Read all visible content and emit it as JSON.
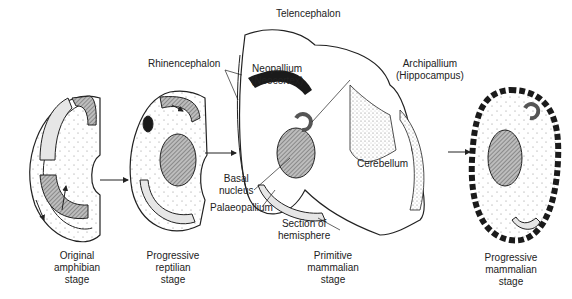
{
  "labels": {
    "telencephalon": "Telencephalon",
    "rhinencephalon": "Rhinencephalon",
    "neopallium": [
      "Neopallium",
      "(Neocortex)"
    ],
    "archipallium": [
      "Archipallium",
      "(Hippocampus)"
    ],
    "cerebellum": "Cerebellum",
    "basal_nucleus": [
      "Basal",
      "nucleus"
    ],
    "palaeopallium": "Palaeopallium",
    "section": [
      "Section of",
      "hemisphere"
    ]
  },
  "stages": [
    {
      "lines": [
        "Original",
        "amphibian",
        "stage"
      ]
    },
    {
      "lines": [
        "Progressive",
        "reptilian",
        "stage"
      ]
    },
    {
      "lines": [
        "Primitive",
        "mammalian",
        "stage"
      ]
    },
    {
      "lines": [
        "Progressive",
        "mammalian",
        "stage"
      ]
    }
  ],
  "colors": {
    "line": "#222222",
    "hatch": "#8a8a8a",
    "light_fill": "#e6e6e6",
    "cortex_dark": "#1a1a1a"
  }
}
